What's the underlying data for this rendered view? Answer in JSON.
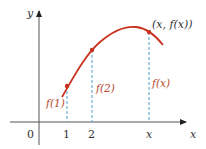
{
  "diagram": {
    "title": "",
    "axes": {
      "x_label": "x",
      "y_label": "y",
      "origin_label": "0",
      "x_ticks": [
        "1",
        "2",
        "x"
      ]
    },
    "curve": {
      "color": "#c8321e",
      "description": "Concave-down function f(x) rising then falling"
    },
    "points": [
      {
        "x_tick": "1",
        "height_label": "f(1)"
      },
      {
        "x_tick": "2",
        "height_label": "f(2)"
      },
      {
        "x_tick": "x",
        "height_label": "f(x)",
        "point_label": "(x, f(x))"
      }
    ],
    "colors": {
      "curve": "#c8321e",
      "dashed_lines": "#4f9fc9",
      "axes": "#333333",
      "labels_red": "#b5482c"
    }
  }
}
